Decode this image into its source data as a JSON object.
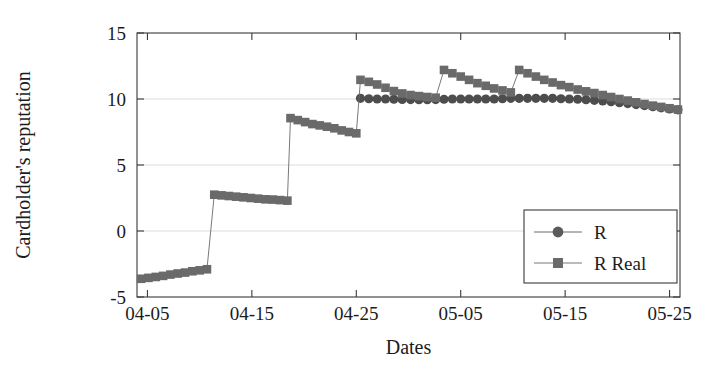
{
  "chart_data": {
    "type": "line",
    "title": "",
    "xlabel": "Dates",
    "ylabel": "Cardholder's reputation",
    "xtick_labels": [
      "04-05",
      "04-15",
      "04-25",
      "05-05",
      "05-15",
      "05-25"
    ],
    "xtick_values": [
      5,
      15,
      25,
      35,
      45,
      55
    ],
    "ytick_labels": [
      "-5",
      "0",
      "5",
      "10",
      "15"
    ],
    "ytick_values": [
      -5,
      0,
      5,
      10,
      15
    ],
    "ylim": [
      -5,
      15
    ],
    "xlim": [
      4,
      56
    ],
    "grid": "horizontal",
    "legend_position": "lower-right",
    "legend_entries": [
      {
        "name": "R",
        "marker": "circle",
        "color": "#5a5a5a"
      },
      {
        "name": "R Real",
        "marker": "square",
        "color": "#6a6a6a"
      }
    ],
    "series": [
      {
        "name": "R",
        "marker": "circle",
        "color": "#4d4d4d",
        "x": [
          25.4,
          26.2,
          27.0,
          27.8,
          28.6,
          29.4,
          30.2,
          31.0,
          31.8,
          32.6,
          33.4,
          34.2,
          35.0,
          35.8,
          36.6,
          37.4,
          38.2,
          39.0,
          39.8,
          40.6,
          41.4,
          42.2,
          43.0,
          43.8,
          44.6,
          45.4,
          46.2,
          47.0,
          47.8,
          48.6,
          49.4,
          50.2,
          51.0,
          51.8,
          52.6,
          53.4,
          54.2,
          55.0,
          55.8
        ],
        "y": [
          10.05,
          10.02,
          10.0,
          10.0,
          9.98,
          9.97,
          9.96,
          9.95,
          9.95,
          9.96,
          9.98,
          10.0,
          10.0,
          10.0,
          10.0,
          10.0,
          10.0,
          10.02,
          10.05,
          10.05,
          10.05,
          10.05,
          10.05,
          10.05,
          10.02,
          10.0,
          9.98,
          9.95,
          9.9,
          9.85,
          9.8,
          9.72,
          9.65,
          9.58,
          9.5,
          9.42,
          9.33,
          9.25,
          9.18
        ]
      },
      {
        "name": "R Real",
        "marker": "square",
        "color": "#6a6a6a",
        "x": [
          4.4,
          5.1,
          5.8,
          6.5,
          7.2,
          7.9,
          8.6,
          9.3,
          10.0,
          10.7,
          11.4,
          12.1,
          12.8,
          13.5,
          14.2,
          14.9,
          15.6,
          16.3,
          17.0,
          17.7,
          18.4,
          18.7,
          19.4,
          20.1,
          20.8,
          21.5,
          22.2,
          22.9,
          23.6,
          24.3,
          25.0,
          25.4,
          26.2,
          27.0,
          27.8,
          28.6,
          29.4,
          30.2,
          31.0,
          31.8,
          32.6,
          33.4,
          34.2,
          35.0,
          35.8,
          36.6,
          37.4,
          38.2,
          39.0,
          39.8,
          40.6,
          41.4,
          42.2,
          43.0,
          43.8,
          44.6,
          45.4,
          46.2,
          47.0,
          47.8,
          48.6,
          49.4,
          50.2,
          51.0,
          51.8,
          52.6,
          53.4,
          54.2,
          55.0,
          55.8
        ],
        "y": [
          -3.62,
          -3.55,
          -3.48,
          -3.4,
          -3.3,
          -3.22,
          -3.15,
          -3.05,
          -2.98,
          -2.9,
          2.75,
          2.7,
          2.65,
          2.6,
          2.55,
          2.5,
          2.45,
          2.4,
          2.38,
          2.34,
          2.3,
          8.55,
          8.4,
          8.25,
          8.1,
          8.0,
          7.9,
          7.78,
          7.62,
          7.5,
          7.4,
          11.45,
          11.3,
          11.1,
          10.85,
          10.6,
          10.42,
          10.3,
          10.22,
          10.15,
          10.1,
          12.2,
          11.95,
          11.7,
          11.45,
          11.2,
          11.0,
          10.8,
          10.65,
          10.5,
          12.2,
          11.95,
          11.7,
          11.45,
          11.25,
          11.05,
          10.9,
          10.72,
          10.58,
          10.45,
          10.3,
          10.15,
          10.0,
          9.88,
          9.75,
          9.62,
          9.5,
          9.4,
          9.3,
          9.2
        ]
      }
    ]
  },
  "legend": {
    "entry_r": "R",
    "entry_r_real": "R Real"
  },
  "axes": {
    "x_title": "Dates",
    "y_title": "Cardholder's reputation"
  }
}
